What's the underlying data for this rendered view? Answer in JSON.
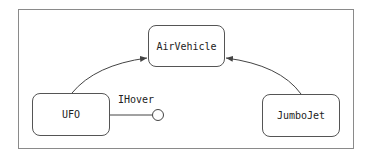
{
  "diagram": {
    "type": "uml-class-dependency",
    "nodes": [
      {
        "id": "airvehicle",
        "label": "AirVehicle"
      },
      {
        "id": "ufo",
        "label": "UFO"
      },
      {
        "id": "jumbojet",
        "label": "JumboJet"
      }
    ],
    "interface": {
      "label": "IHover",
      "attached_to": "UFO"
    },
    "edges": [
      {
        "from": "UFO",
        "to": "AirVehicle",
        "kind": "generalization-arrow"
      },
      {
        "from": "JumboJet",
        "to": "AirVehicle",
        "kind": "generalization-arrow"
      },
      {
        "from": "UFO",
        "to": "IHover",
        "kind": "lollipop-interface"
      }
    ],
    "colors": {
      "line": "#444444",
      "frame": "#8a8a8a",
      "background": "#ffffff"
    }
  }
}
